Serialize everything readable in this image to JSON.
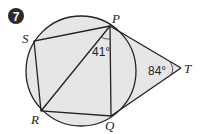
{
  "problem": {
    "number": "7",
    "badge_color": "#2b2b2b"
  },
  "diagram": {
    "fill_color": "#e6e6e6",
    "stroke_color": "#222222",
    "points": {
      "P": "P",
      "Q": "Q",
      "R": "R",
      "S": "S",
      "T": "T"
    },
    "angles": {
      "RPQ": "41°",
      "PTQ": "84°"
    }
  }
}
